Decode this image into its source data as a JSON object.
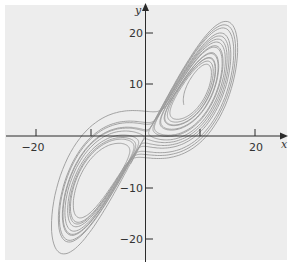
{
  "chart_data": {
    "type": "line",
    "title": "",
    "xlabel": "x",
    "ylabel": "y",
    "xlim": [
      -26,
      26
    ],
    "ylim": [
      -25,
      26
    ],
    "grid": false,
    "legend": null,
    "x_ticks": [
      -20,
      -10,
      0,
      10,
      20
    ],
    "x_tick_labels": [
      "−20",
      "",
      "",
      "",
      "20"
    ],
    "y_ticks": [
      -20,
      -10,
      10,
      20
    ],
    "y_tick_labels": [
      "−20",
      "−10",
      "10",
      "20"
    ],
    "series": [
      {
        "name": "Lorenz trajectory",
        "system": {
          "sigma": 10,
          "rho": 28,
          "beta": 2.6667
        },
        "initial_point": {
          "x": 7,
          "y": 6,
          "z": 20
        },
        "dt": 0.005,
        "steps": 3800,
        "color": "#9a9a9a",
        "x_range_observed": [
          -18,
          19
        ],
        "y_range_observed": [
          -22,
          25
        ]
      }
    ]
  },
  "colors": {
    "panel_background": "#ededed",
    "page_background": "#ffffff",
    "axis": "#2b2b2b",
    "curve": "#9a9a9a",
    "text": "#333333"
  },
  "axes": {
    "x_label": "x",
    "y_label": "y",
    "x_tick_neg20": "−20",
    "x_tick_pos20": "20",
    "y_tick_20": "20",
    "y_tick_10": "10",
    "y_tick_neg10": "−10",
    "y_tick_neg20": "−20"
  }
}
